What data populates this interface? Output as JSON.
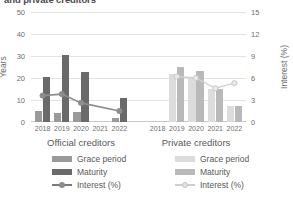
{
  "chart_data": {
    "type": "bar",
    "title": "and private creditors",
    "categories": [
      "2018",
      "2019",
      "2020",
      "2021",
      "2022"
    ],
    "ylabel": "Years",
    "y2label": "Interest (%)",
    "ylim": [
      0,
      50
    ],
    "y2lim": [
      0,
      15
    ],
    "yticks": [
      "0",
      "10",
      "20",
      "30",
      "40",
      "50"
    ],
    "y2ticks": [
      "0",
      "3",
      "6",
      "9",
      "12",
      "15"
    ],
    "grid": true,
    "legend_position": "bottom",
    "panels": [
      {
        "name": "Official creditors",
        "label": "Official creditors",
        "series": [
          {
            "name": "Grace period",
            "type": "bar",
            "color": "#9a9a9a",
            "values": [
              5.2,
              4.0,
              4.6,
              null,
              1.7
            ]
          },
          {
            "name": "Maturity",
            "type": "bar",
            "color": "#6a6a6a",
            "values": [
              20.5,
              30.6,
              22.6,
              null,
              11.0
            ]
          },
          {
            "name": "Interest (%)",
            "type": "line",
            "color": "#8d8d8d",
            "axis": "right",
            "values": [
              3.6,
              3.8,
              2.6,
              null,
              1.5
            ]
          }
        ]
      },
      {
        "name": "Private creditors",
        "label": "Private creditors",
        "series": [
          {
            "name": "Grace period",
            "type": "bar",
            "color": "#dcdcdc",
            "values": [
              null,
              21.8,
              19.8,
              14.8,
              7.2
            ]
          },
          {
            "name": "Maturity",
            "type": "bar",
            "color": "#b9b9b9",
            "values": [
              null,
              25.2,
              23.0,
              15.0,
              7.2
            ]
          },
          {
            "name": "Interest (%)",
            "type": "line",
            "color": "#e2e2e2",
            "axis": "right",
            "values": [
              null,
              6.2,
              6.0,
              4.6,
              5.3
            ]
          }
        ]
      }
    ]
  },
  "legend": {
    "official": [
      {
        "label": "Grace period",
        "kind": "swatch",
        "cls": "sw-grace-off"
      },
      {
        "label": "Maturity",
        "kind": "swatch",
        "cls": "sw-mat-off"
      },
      {
        "label": "Interest (%)",
        "kind": "line",
        "cls": "off"
      }
    ],
    "private": [
      {
        "label": "Grace period",
        "kind": "swatch",
        "cls": "sw-grace-pri"
      },
      {
        "label": "Maturity",
        "kind": "swatch",
        "cls": "sw-mat-pri"
      },
      {
        "label": "Interest (%)",
        "kind": "line",
        "cls": "pri"
      }
    ]
  }
}
